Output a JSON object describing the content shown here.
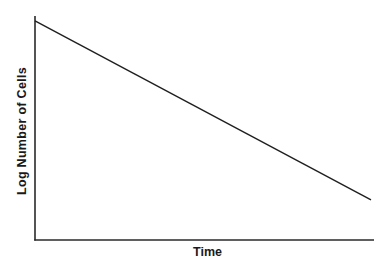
{
  "chart_data": {
    "type": "line",
    "title": "",
    "xlabel": "Time",
    "ylabel": "Log Number of Cells",
    "grid": false,
    "legend": null,
    "x_ticks": [],
    "y_ticks": [],
    "series": [
      {
        "name": "Log Number of Cells",
        "x": [
          0,
          1
        ],
        "y": [
          0.978,
          0.179
        ],
        "note": "Straight decreasing line (exponential decline on log scale); values normalized to axis range 0-1"
      }
    ],
    "xlim": [
      0,
      1
    ],
    "ylim": [
      0,
      1
    ],
    "colors": {
      "line": "#1f1f1f",
      "axis": "#2a2a2a",
      "background": "#ffffff"
    }
  },
  "axes": {
    "x_title": "Time",
    "y_title": "Log Number of Cells"
  }
}
